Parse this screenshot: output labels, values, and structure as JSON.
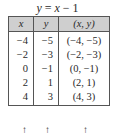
{
  "title": {
    "lhs": "y",
    "eq": " = ",
    "rhs_var": "x",
    "rhs_rest": " − 1"
  },
  "table": {
    "headers": [
      "x",
      "y",
      "(x, y)"
    ],
    "rows": [
      {
        "x": "−4",
        "y": "−5",
        "pair": "(−4, −5)"
      },
      {
        "x": "−2",
        "y": "−3",
        "pair": "(−2, −3)"
      },
      {
        "x": "0",
        "y": "−1",
        "pair": "(0, −1)"
      },
      {
        "x": "2",
        "y": "1",
        "pair": "(2, 1)"
      },
      {
        "x": "4",
        "y": "3",
        "pair": "(4, 3)"
      }
    ],
    "header_bg": "#cfcfcf"
  },
  "arrows": {
    "glyph": "↑"
  }
}
